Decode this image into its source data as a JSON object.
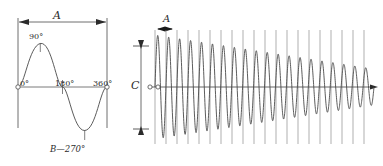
{
  "figure": {
    "background_color": "#ffffff",
    "line_color": "#4a4a4a",
    "text_color": "#2b2b2b",
    "width": 383,
    "height": 166
  },
  "left_panel": {
    "name": "single-sine-cycle",
    "dimension_label_top": "A",
    "bottom_label": "B—270°",
    "axis_labels": {
      "start": "0°",
      "peak": "90°",
      "zero_cross": "180°",
      "end": "360°"
    },
    "geometry": {
      "baseline_y": 87,
      "left_x": 18,
      "right_x": 107,
      "amplitude": 45,
      "top_rule_y": 22,
      "vertical_extent": [
        18,
        128
      ]
    }
  },
  "right_panel": {
    "name": "damped-oscillation",
    "period_label": "A",
    "amplitude_label": "C",
    "geometry": {
      "baseline_y": 87,
      "start_x": 155,
      "end_x": 374,
      "grid_top_y": 30,
      "grid_bottom_y": 144,
      "gridline_spacing": 11,
      "gridline_count": 20,
      "initial_amplitude": 52,
      "final_amplitude": 18
    }
  },
  "chart_data": {
    "type": "line",
    "xlabel": "",
    "ylabel": "",
    "series": [
      {
        "name": "single-sine-cycle",
        "description": "One full sine cycle from 0° to 360°",
        "x": [
          0,
          45,
          90,
          135,
          180,
          225,
          270,
          315,
          360
        ],
        "values": [
          0,
          0.707,
          1.0,
          0.707,
          0,
          -0.707,
          -1.0,
          -0.707,
          0
        ],
        "annotations": [
          "0°",
          "90°",
          "180°",
          "360°",
          "B—270°"
        ],
        "amplitude_label": "A"
      },
      {
        "name": "damped-oscillation",
        "description": "High-frequency wave with decaying amplitude",
        "cycles": 20,
        "envelope_start": 1.0,
        "envelope_end": 0.34,
        "period_label": "A",
        "amplitude_label": "C"
      }
    ],
    "grid": true,
    "legend": "none"
  }
}
